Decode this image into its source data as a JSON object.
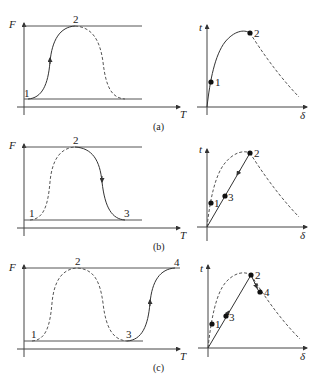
{
  "figure": {
    "panels": [
      {
        "id": "a",
        "caption": "(a)",
        "left": {
          "y_axis_label": "F",
          "x_axis_label": "T",
          "points": [
            {
              "label": "1"
            },
            {
              "label": "2"
            }
          ],
          "solid_path": "1 → 2 (rising)",
          "dashed_path": "2 → down (falling)"
        },
        "right": {
          "y_axis_label": "t",
          "x_axis_label": "δ",
          "points": [
            {
              "label": "1"
            },
            {
              "label": "2"
            }
          ],
          "solid_path": "0 → 1 → 2 (curve)",
          "dashed_path": "2 → decay"
        }
      },
      {
        "id": "b",
        "caption": "(b)",
        "left": {
          "y_axis_label": "F",
          "x_axis_label": "T",
          "points": [
            {
              "label": "1"
            },
            {
              "label": "2"
            },
            {
              "label": "3"
            }
          ],
          "solid_path": "2 → 3 (falling)",
          "dashed_path": "1 → 2 (rising)"
        },
        "right": {
          "y_axis_label": "t",
          "x_axis_label": "δ",
          "points": [
            {
              "label": "1"
            },
            {
              "label": "3"
            },
            {
              "label": "2"
            }
          ],
          "solid_path": "2 → 3 → 0 (straight unloading line)",
          "dashed_path": "envelope curve"
        }
      },
      {
        "id": "c",
        "caption": "(c)",
        "left": {
          "y_axis_label": "F",
          "x_axis_label": "T",
          "points": [
            {
              "label": "1"
            },
            {
              "label": "2"
            },
            {
              "label": "3"
            },
            {
              "label": "4"
            }
          ],
          "solid_path": "3 → 4 (rising)",
          "dashed_path": "1 → 2 → 3"
        },
        "right": {
          "y_axis_label": "t",
          "x_axis_label": "δ",
          "points": [
            {
              "label": "1"
            },
            {
              "label": "3"
            },
            {
              "label": "2"
            },
            {
              "label": "4"
            }
          ],
          "solid_path": "0 → 3 → 2 → 4 (reloading then softening)",
          "dashed_path": "envelope curve"
        }
      }
    ]
  }
}
